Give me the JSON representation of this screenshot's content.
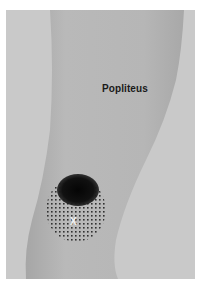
{
  "figure": {
    "muscle_label": "Popliteus",
    "trigger_point_marker": "X",
    "colors": {
      "background": "#c9c9c9",
      "leg_fill": "#b8b8b8",
      "leg_shadow": "#a9a9a9",
      "pain_core": "#0d0d0d",
      "pain_spillover_dots": "#2a2a2a",
      "marker": "#f2f2f2"
    },
    "pain_pattern": {
      "core_center": [
        76,
        189
      ],
      "core_radius": [
        20,
        16
      ],
      "spillover_center": [
        74,
        201
      ],
      "spillover_radius": [
        30,
        35
      ]
    }
  }
}
